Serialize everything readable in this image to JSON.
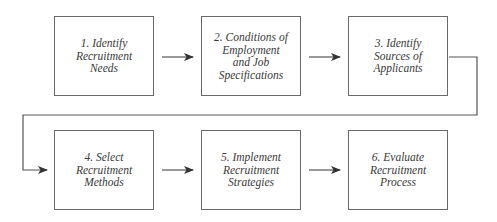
{
  "diagram": {
    "type": "process-flow",
    "steps": [
      {
        "id": 1,
        "label": "1.  Identify\nRecruitment\nNeeds"
      },
      {
        "id": 2,
        "label": "2.  Conditions of\nEmployment\nand Job\nSpecifications"
      },
      {
        "id": 3,
        "label": "3.  Identify\nSources of\nApplicants"
      },
      {
        "id": 4,
        "label": "4.  Select\nRecruitment\nMethods"
      },
      {
        "id": 5,
        "label": "5.  Implement\nRecruitment\nStrategies"
      },
      {
        "id": 6,
        "label": "6.  Evaluate\nRecruitment\nProcess"
      }
    ],
    "edges": [
      {
        "from": 1,
        "to": 2
      },
      {
        "from": 2,
        "to": 3
      },
      {
        "from": 3,
        "to": 4
      },
      {
        "from": 4,
        "to": 5
      },
      {
        "from": 5,
        "to": 6
      }
    ],
    "colors": {
      "line": "#555555",
      "border": "#6a6a6a",
      "text": "#3a3a3a",
      "background": "#ffffff"
    }
  }
}
